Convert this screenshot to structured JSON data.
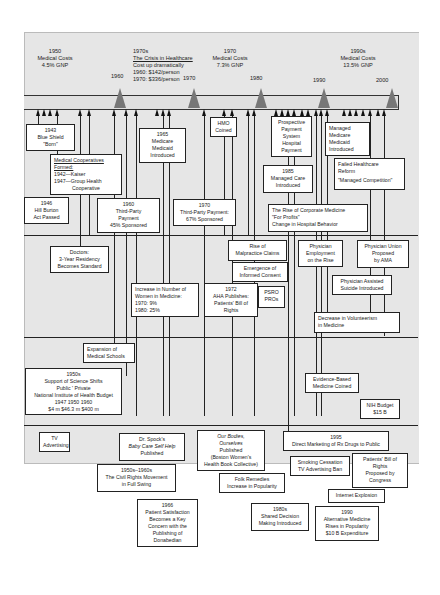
{
  "header_notes": [
    {
      "id": "1950",
      "lines": [
        "1950",
        "Medical Costs",
        "4.5% GNP"
      ]
    },
    {
      "id": "1970s",
      "lines": [
        "1970s",
        "The Crisis in Healthcare",
        "Cost up dramatically",
        "1960: $142/person",
        "1970: $336/person"
      ]
    },
    {
      "id": "1970",
      "lines": [
        "1970",
        "Medical Costs",
        "7.3% GNP"
      ]
    },
    {
      "id": "1990s",
      "lines": [
        "1990s",
        "Medical Costs",
        "13.5% GNP"
      ]
    }
  ],
  "decades": [
    "1960",
    "1970",
    "1980",
    "1990",
    "2000"
  ],
  "boxes": {
    "blue_shield": [
      "1943",
      "Blue Shield",
      "\"Born\""
    ],
    "coops": [
      "Medical Cooperatives",
      "Formed:",
      "1942—Kaiser",
      "1947—Group Health",
      "Cooperative"
    ],
    "hill_burton": [
      "1946",
      "Hill Burton",
      "Act Passed"
    ],
    "tp_1960": [
      "1960",
      "Third-Party",
      "Payment",
      "45% Sponsored"
    ],
    "medicare": [
      "1965",
      "Medicare",
      "Medicaid",
      "Introduced"
    ],
    "hmo": [
      "HMO",
      "Coined"
    ],
    "tp_1970": [
      "1970",
      "Third-Party Payment:",
      "67% Sponsored"
    ],
    "pps": [
      "Prospective",
      "Payment",
      "System",
      "Hospital",
      "Payment"
    ],
    "managed_care": [
      "1985",
      "Managed Care",
      "Introduced"
    ],
    "managed_medicare": [
      "Managed",
      "Medicare",
      "Medicaid",
      "Introduced"
    ],
    "failed_reform": [
      "Failed Healthcare",
      "Reform",
      "\"Managed Competition\""
    ],
    "corporate": [
      "The Rise of Corporate Medicine",
      "\"For Profits\"",
      "Change in Hospital Behavior"
    ],
    "doctors": [
      "Doctors:",
      "3-Year Residency",
      "Becomes Standard"
    ],
    "malpractice": [
      "Rise of",
      "Malpractice Claims"
    ],
    "informed_consent": [
      "Emergence of",
      "Informed Consent"
    ],
    "phys_employment": [
      "Physician",
      "Employment",
      "on the Rise"
    ],
    "phys_union": [
      "Physician Union",
      "Proposed",
      "by AMA"
    ],
    "women": [
      "Increase in Number of",
      "Women in Medicine:",
      "1970:  9%",
      "1980: 25%"
    ],
    "aha": [
      "1972",
      "AHA Publishes:",
      "Patients' Bill of",
      "Rights"
    ],
    "psro": [
      "PSRO",
      "PROs"
    ],
    "pas": [
      "Physician Assisted",
      "Suicide Introduced"
    ],
    "volunteer": [
      "Decrease in Volunteerism",
      "in Medicine"
    ],
    "med_schools": [
      "Expansion of",
      "Medical Schools"
    ],
    "science": [
      "1950s",
      "Support of Science Shifts",
      "Public  '  Private",
      "National Institute of  Health Budget",
      "1947        1950        1960",
      "$4 m       $46.3 m      $400 m"
    ],
    "ebm": [
      "Evidence-Based",
      "Medicine Coined"
    ],
    "nih": [
      "NIH Budget",
      "$15 B"
    ],
    "tv": [
      "TV",
      "Advertising"
    ],
    "spock": [
      "Dr. Spock's",
      "Baby Care Self Help",
      "Published"
    ],
    "our_bodies": [
      "Our Bodies,",
      "Ourselves",
      "Published",
      "(Boston Women's",
      "Health Book Collective)"
    ],
    "rx": [
      "1995",
      "Direct Marketing of Rx Drugs to Public"
    ],
    "civil_rights": [
      "1950s–1960s",
      "The Civil Rights Movement",
      "in Full Swing"
    ],
    "folk": [
      "Folk Remedies",
      "Increase in Popularity"
    ],
    "smoking": [
      "Smoking Cessation",
      "TV Advertising Ban"
    ],
    "pbr_congress": [
      "Patients' Bill of",
      "Rights",
      "Proposed by",
      "Congress"
    ],
    "internet": [
      "Internet Explosion"
    ],
    "donabedian": [
      "1966",
      "Patient Satisfaction",
      "Becomes a Key",
      "Concern with the",
      "Publishing of",
      "Donabedian"
    ],
    "shared": [
      "1980s",
      "Shared Decision",
      "Making Introduced"
    ],
    "alt_med": [
      "1990",
      "Alternative Medicine",
      "Rises in Popularity",
      "$10 B Expenditure"
    ]
  }
}
